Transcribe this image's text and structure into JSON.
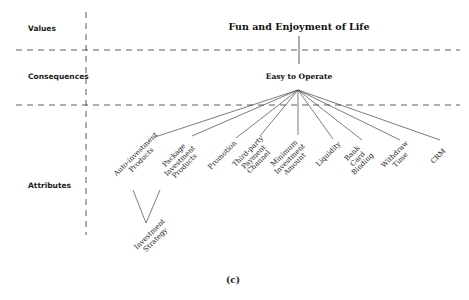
{
  "levels": {
    "values": "Values",
    "consequences": "Consequences",
    "attributes": "Attributes"
  },
  "nodes": {
    "value": "Fun and Enjoyment of Life",
    "consequence": "Easy to Operate"
  },
  "attributes": [
    {
      "id": "auto",
      "label": "Auto-investment\nProducts"
    },
    {
      "id": "package",
      "label": "Package\nInvestment\nProducts"
    },
    {
      "id": "promotion",
      "label": "Promotion"
    },
    {
      "id": "thirdparty",
      "label": "Third-party\nPayment\nChannel"
    },
    {
      "id": "minimum",
      "label": "Minimum\nInvestment\nAmount"
    },
    {
      "id": "liquidity",
      "label": "Liquidity"
    },
    {
      "id": "bankcard",
      "label": "Bank\nCard\nBinding"
    },
    {
      "id": "withdraw",
      "label": "Withdraw\nTime"
    },
    {
      "id": "crm",
      "label": "CRM"
    }
  ],
  "sub_attributes": [
    {
      "id": "strategy",
      "label": "Investment\nStrategy"
    }
  ],
  "caption": "(c)"
}
